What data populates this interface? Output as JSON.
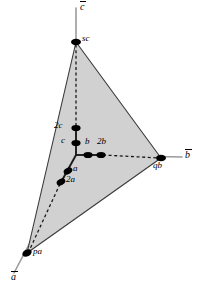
{
  "figure": {
    "type": "crystallographic-axes-diagram",
    "width": 206,
    "height": 295,
    "background_color": "#ffffff",
    "plane_fill_color": "#cfcfcf",
    "plane_stroke_color": "#3a3a3a",
    "axis_color": "#9a9a9a",
    "emphasis_color": "#1a1a1a",
    "dot_color": "#000000"
  },
  "axes": [
    {
      "id": "a",
      "label": "a",
      "overbar": true,
      "label_x": 11,
      "label_y": 272,
      "direction": "lower-left"
    },
    {
      "id": "b",
      "label": "b",
      "overbar": true,
      "label_x": 185,
      "label_y": 150,
      "direction": "right"
    },
    {
      "id": "c",
      "label": "c",
      "overbar": true,
      "label_x": 80,
      "label_y": 2,
      "direction": "up"
    }
  ],
  "origin": {
    "x": 76,
    "y": 155
  },
  "points": [
    {
      "id": "sc",
      "label": "sc",
      "x": 76,
      "y": 42,
      "axis": "c",
      "label_x": 82,
      "label_y": 36,
      "label_align": "left"
    },
    {
      "id": "2c",
      "label": "2c",
      "x": 76,
      "y": 128,
      "axis": "c",
      "label_x": 56,
      "label_y": 122,
      "label_align": "left"
    },
    {
      "id": "c",
      "label": "c",
      "x": 76,
      "y": 143,
      "axis": "c",
      "label_x": 62,
      "label_y": 137,
      "label_align": "left"
    },
    {
      "id": "b",
      "label": "b",
      "x": 88,
      "y": 155,
      "axis": "b",
      "label_x": 85,
      "label_y": 138,
      "label_align": "left"
    },
    {
      "id": "2b",
      "label": "2b",
      "x": 101,
      "y": 155,
      "axis": "b",
      "label_x": 96,
      "label_y": 138,
      "label_align": "left"
    },
    {
      "id": "qb",
      "label": "qb",
      "x": 161,
      "y": 158,
      "axis": "b",
      "label_x": 154,
      "label_y": 162,
      "label_align": "left"
    },
    {
      "id": "a",
      "label": "a",
      "x": 68,
      "y": 171,
      "axis": "a",
      "label_x": 73,
      "label_y": 165,
      "label_align": "left"
    },
    {
      "id": "2a",
      "label": "2a",
      "x": 61,
      "y": 182,
      "axis": "a",
      "label_x": 66,
      "label_y": 176,
      "label_align": "left"
    },
    {
      "id": "pa",
      "label": "pa",
      "x": 27,
      "y": 253,
      "axis": "a",
      "label_x": 33,
      "label_y": 248,
      "label_align": "left"
    }
  ],
  "plane": {
    "name": "shaded-intercept-triangle",
    "vertices": [
      {
        "point": "sc",
        "x": 76,
        "y": 42
      },
      {
        "point": "qb",
        "x": 161,
        "y": 158
      },
      {
        "point": "pa",
        "x": 27,
        "y": 253
      }
    ]
  },
  "segments": [
    {
      "name": "c-axis-line",
      "style": "axis",
      "x1": 76,
      "y1": 8,
      "x2": 76,
      "y2": 155
    },
    {
      "name": "b-axis-line",
      "style": "axis",
      "x1": 76,
      "y1": 155,
      "x2": 182,
      "y2": 157
    },
    {
      "name": "a-axis-line",
      "style": "axis",
      "x1": 76,
      "y1": 155,
      "x2": 14,
      "y2": 273
    },
    {
      "name": "c-axis-solid-to-2c",
      "style": "emphasis",
      "x1": 76,
      "y1": 155,
      "x2": 76,
      "y2": 126
    },
    {
      "name": "c-axis-dashed-2c-to-sc",
      "style": "dashed",
      "x1": 76,
      "y1": 126,
      "x2": 76,
      "y2": 44
    },
    {
      "name": "b-axis-solid-to-2b",
      "style": "emphasis",
      "x1": 76,
      "y1": 155,
      "x2": 103,
      "y2": 155
    },
    {
      "name": "b-axis-dashed-2b-to-qb",
      "style": "dashed",
      "x1": 103,
      "y1": 155,
      "x2": 159,
      "y2": 158
    },
    {
      "name": "a-axis-solid-to-2a",
      "style": "emphasis",
      "x1": 76,
      "y1": 155,
      "x2": 60,
      "y2": 184
    },
    {
      "name": "a-axis-dashed-2a-to-pa",
      "style": "dashed",
      "x1": 60,
      "y1": 184,
      "x2": 29,
      "y2": 251
    }
  ]
}
